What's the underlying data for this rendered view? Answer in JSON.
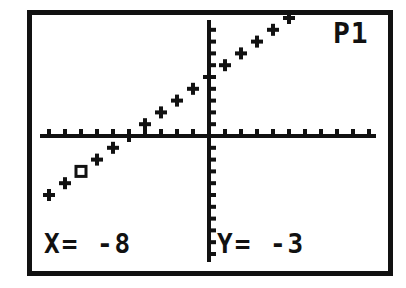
{
  "screen": {
    "plot_indicator": "P1",
    "trace": {
      "x_label": "X=",
      "x_value": "-8",
      "y_label": "Y=",
      "y_value": "-3",
      "x_text": "X= -8",
      "y_text": "Y= -3"
    },
    "colors": {
      "ink": "#111111",
      "background": "#ffffff"
    }
  },
  "chart_data": {
    "type": "scatter",
    "title": "",
    "legend": [
      "P1"
    ],
    "xlabel": "X",
    "ylabel": "Y",
    "grid": false,
    "axes_ticks": true,
    "cursor": {
      "x": -8,
      "y": -3
    },
    "series": [
      {
        "name": "P1",
        "marker": "+",
        "points": [
          [
            -10,
            -5
          ],
          [
            -9,
            -4
          ],
          [
            -8,
            -3
          ],
          [
            -7,
            -2
          ],
          [
            -6,
            -1
          ],
          [
            -5,
            0
          ],
          [
            -4,
            1
          ],
          [
            -3,
            2
          ],
          [
            -2,
            3
          ],
          [
            -1,
            4
          ],
          [
            0,
            5
          ],
          [
            1,
            6
          ],
          [
            2,
            7
          ],
          [
            3,
            8
          ],
          [
            4,
            9
          ],
          [
            5,
            10
          ]
        ]
      }
    ],
    "xlim": [
      -10.5,
      10.5
    ],
    "ylim": [
      -11,
      10
    ]
  }
}
